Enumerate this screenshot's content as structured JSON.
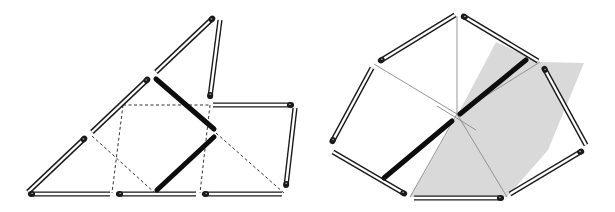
{
  "figure": {
    "colors": {
      "background": "#ffffff",
      "match_outline": "#1a1a1a",
      "match_fill": "#ffffff",
      "match_head": "#1a1a1a",
      "thick_stick": "#0d0d0d",
      "dashed_line": "#333333",
      "thin_line": "#8a8a8a",
      "shade": "#d9d9d9"
    },
    "left": {
      "name": "triangle-arrangement",
      "matches": [
        {
          "x1": 28,
          "y1": 192,
          "x2": 85,
          "y2": 138,
          "head": "end"
        },
        {
          "x1": 92,
          "y1": 132,
          "x2": 148,
          "y2": 79,
          "head": "end"
        },
        {
          "x1": 156,
          "y1": 72,
          "x2": 213,
          "y2": 18,
          "head": "end"
        },
        {
          "x1": 220,
          "y1": 20,
          "x2": 210,
          "y2": 97,
          "head": "end"
        },
        {
          "x1": 213,
          "y1": 105,
          "x2": 292,
          "y2": 105,
          "head": "end"
        },
        {
          "x1": 295,
          "y1": 108,
          "x2": 286,
          "y2": 186,
          "head": "end"
        },
        {
          "x1": 30,
          "y1": 194,
          "x2": 110,
          "y2": 194,
          "head": "start"
        },
        {
          "x1": 118,
          "y1": 194,
          "x2": 196,
          "y2": 194,
          "head": "start"
        },
        {
          "x1": 204,
          "y1": 194,
          "x2": 282,
          "y2": 194,
          "head": "start"
        }
      ],
      "thick_sticks": [
        {
          "x1": 156,
          "y1": 79,
          "x2": 214,
          "y2": 129
        },
        {
          "x1": 214,
          "y1": 137,
          "x2": 157,
          "y2": 190
        }
      ],
      "dashed_lines": [
        {
          "x1": 123,
          "y1": 105,
          "x2": 210,
          "y2": 105
        },
        {
          "x1": 123,
          "y1": 105,
          "x2": 112,
          "y2": 193
        },
        {
          "x1": 210,
          "y1": 105,
          "x2": 200,
          "y2": 193
        },
        {
          "x1": 92,
          "y1": 136,
          "x2": 155,
          "y2": 193
        },
        {
          "x1": 216,
          "y1": 133,
          "x2": 284,
          "y2": 193
        }
      ]
    },
    "right": {
      "name": "polygon-arrangement",
      "shaded_regions": [
        "496,42 458,114 410,197 507,197 548,150 584,63 540,62"
      ],
      "thin_lines": [
        {
          "x1": 457,
          "y1": 16,
          "x2": 457,
          "y2": 114
        },
        {
          "x1": 374,
          "y1": 64,
          "x2": 457,
          "y2": 114
        },
        {
          "x1": 540,
          "y1": 62,
          "x2": 457,
          "y2": 114
        },
        {
          "x1": 457,
          "y1": 114,
          "x2": 410,
          "y2": 197
        },
        {
          "x1": 457,
          "y1": 114,
          "x2": 507,
          "y2": 197
        },
        {
          "x1": 437,
          "y1": 106,
          "x2": 476,
          "y2": 130
        }
      ],
      "matches": [
        {
          "x1": 455,
          "y1": 15,
          "x2": 380,
          "y2": 61,
          "head": "end"
        },
        {
          "x1": 463,
          "y1": 16,
          "x2": 538,
          "y2": 61,
          "head": "start"
        },
        {
          "x1": 372,
          "y1": 68,
          "x2": 332,
          "y2": 142,
          "head": "end"
        },
        {
          "x1": 544,
          "y1": 68,
          "x2": 586,
          "y2": 145,
          "head": "start"
        },
        {
          "x1": 333,
          "y1": 152,
          "x2": 405,
          "y2": 194,
          "head": "end"
        },
        {
          "x1": 582,
          "y1": 151,
          "x2": 510,
          "y2": 194,
          "head": "start"
        },
        {
          "x1": 414,
          "y1": 198,
          "x2": 502,
          "y2": 198,
          "head": "end"
        }
      ],
      "thick_sticks": [
        {
          "x1": 526,
          "y1": 60,
          "x2": 460,
          "y2": 114
        },
        {
          "x1": 452,
          "y1": 121,
          "x2": 384,
          "y2": 178
        }
      ]
    }
  }
}
